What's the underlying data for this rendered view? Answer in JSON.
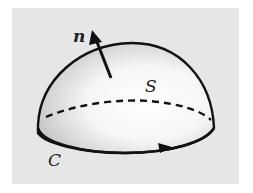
{
  "diagram": {
    "labels": {
      "normal": "n",
      "surface": "S",
      "curve": "C"
    },
    "colors": {
      "background": "#e6e6e6",
      "stroke": "#111111",
      "surface_light": "#ffffff",
      "surface_shade": "#bdbdbd"
    }
  }
}
